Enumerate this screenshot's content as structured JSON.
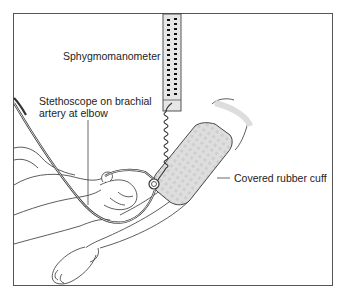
{
  "figure": {
    "labels": {
      "sphygmomanometer": "Sphygmomanometer",
      "stethoscope_line1": "Stethoscope on brachial",
      "stethoscope_line2": "artery at elbow",
      "cuff": "Covered rubber cuff"
    },
    "components": [
      "sphygmomanometer",
      "coiled-tube",
      "stethoscope",
      "rubber-cuff",
      "patient-arm",
      "examiner-hand"
    ],
    "colors": {
      "line": "#333333",
      "frame": "#555555",
      "cuff_fill": "#dcdcdc",
      "manometer_fill": "#e6e6e6"
    }
  }
}
